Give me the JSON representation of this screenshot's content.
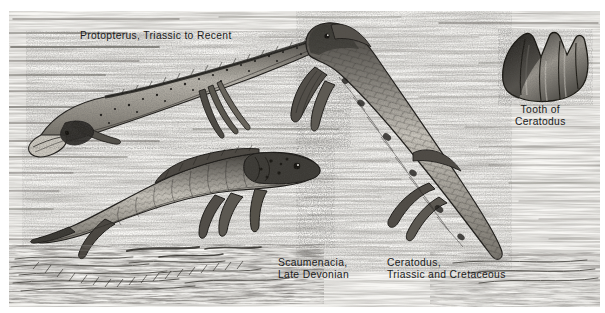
{
  "plate": {
    "kind": "scientific-illustration",
    "subject": "Lungfishes (Dipnoi) — comparative pen-and-ink plate",
    "technique": "stipple and hatch line engraving",
    "background_color": "#f8f7f4",
    "ink_color": "#1b1b1b",
    "water_hatch_color": "#6d6a64"
  },
  "labels": {
    "protopterus": "Protopterus, Triassic to Recent",
    "scaumenacia": "Scaumenacia,\nLate Devonian",
    "ceratodus": "Ceratodus,\nTriassic and Cretaceous",
    "tooth": "Tooth of\nCeratodus"
  },
  "specimens": [
    {
      "name": "Protopterus",
      "range": "Triassic to Recent",
      "position": "upper-left",
      "description": "long eel-like speckled body, pointed head lower-left, thread-like paired fins, continuous dorsal fringe"
    },
    {
      "name": "Scaumenacia",
      "range": "Late Devonian",
      "position": "lower-left",
      "description": "deep scaled body facing right, long tapering tail to the left, high dorsal fin"
    },
    {
      "name": "Ceratodus",
      "range": "Triassic and Cretaceous",
      "position": "centre-right",
      "description": "large heavily scaled body angled from upper-left to lower-right, paddle-shaped paired fins"
    },
    {
      "name": "Tooth of Ceratodus",
      "range": "",
      "position": "upper-right inset",
      "description": "fan-shaped ridged tooth plate with pointed cusps along the upper margin"
    }
  ]
}
